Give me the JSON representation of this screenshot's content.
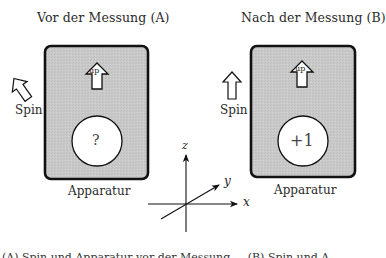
{
  "panels": {
    "a": {
      "title": "Vor der Messung (A)",
      "spin_label": "Spin",
      "spin_direction": "up-left (tilted)",
      "apparatus_label": "Apparatur",
      "arrow_label": "up",
      "readout": "?"
    },
    "b": {
      "title": "Nach der Messung (B)",
      "spin_label": "Spin",
      "spin_direction": "up",
      "apparatus_label": "Apparatur",
      "arrow_label": "up",
      "readout": "+1"
    }
  },
  "axes": {
    "x": "x",
    "y": "y",
    "z": "z"
  },
  "caption": "(A) Spin und Apparatur vor der Messung ... (B) Spin und A...",
  "colors": {
    "apparatus_fill": "#c8c8c8",
    "apparatus_border": "#111111",
    "readout_fill": "#ffffff",
    "line": "#111111"
  }
}
